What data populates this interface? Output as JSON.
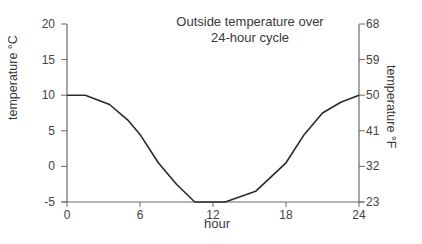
{
  "chart_data": {
    "type": "line",
    "title": "Outside temperature over 24-hour cycle",
    "title_lines": [
      "Outside temperature over",
      "24-hour cycle"
    ],
    "xlabel": "hour",
    "ylabel": "temperature °C",
    "ylabel_right": "temperature °F",
    "xlim": [
      0,
      24
    ],
    "ylim": [
      -5,
      20
    ],
    "ylim_right": [
      23,
      68
    ],
    "x_ticks": [
      0,
      6,
      12,
      18,
      24
    ],
    "y_ticks": [
      -5,
      0,
      5,
      10,
      15,
      20
    ],
    "y_ticks_right": [
      23,
      32,
      41,
      50,
      59,
      68
    ],
    "grid": false,
    "legend": null,
    "series": [
      {
        "name": "Outside temperature",
        "color": "#2a2a2a",
        "x": [
          0,
          1.5,
          3.5,
          5,
          6,
          7.5,
          9,
          10.5,
          13,
          15.5,
          18,
          19.5,
          21,
          22.5,
          24
        ],
        "values": [
          10,
          10,
          8.7,
          6.5,
          4.5,
          0.5,
          -2.5,
          -5,
          -5,
          -3.5,
          0.5,
          4.5,
          7.5,
          9,
          10
        ]
      }
    ]
  }
}
